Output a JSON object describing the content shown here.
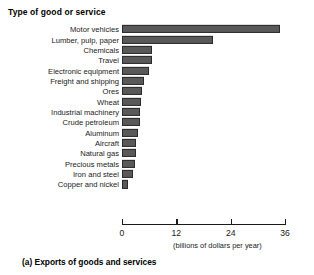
{
  "chart_data": {
    "type": "bar",
    "orientation": "horizontal",
    "title": "Type of good or service",
    "xlabel": "(billions of dollars per year)",
    "ylabel": "Type of good or service",
    "caption": "(a) Exports of goods and services",
    "xlim": [
      0,
      36
    ],
    "xticks": [
      0,
      12,
      24,
      36
    ],
    "xtick_labels": [
      "0",
      "12",
      "24",
      "36"
    ],
    "grid": false,
    "legend": null,
    "bar_color": "#595959",
    "bar_edge_color": "#2b2b2b",
    "categories": [
      "Motor vehicles",
      "Lumber, pulp, paper",
      "Chemicals",
      "Travel",
      "Electronic equipment",
      "Freight and shipping",
      "Ores",
      "Wheat",
      "Industrial machinery",
      "Crude petroleum",
      "Aluminum",
      "Aircraft",
      "Natural gas",
      "Precious metals",
      "Iron and steel",
      "Copper and nickel"
    ],
    "values": [
      35,
      20,
      6.6,
      6.6,
      6.0,
      4.8,
      4.4,
      4.2,
      4.0,
      3.9,
      3.6,
      3.2,
      3.0,
      2.8,
      2.4,
      1.4
    ]
  }
}
